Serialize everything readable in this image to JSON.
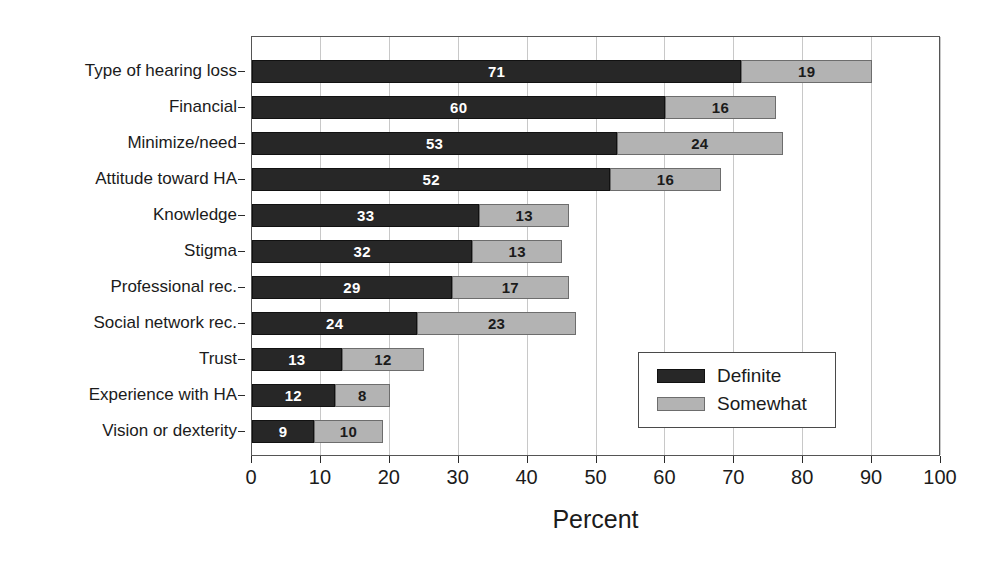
{
  "chart_data": {
    "type": "bar",
    "orientation": "horizontal",
    "stacked": true,
    "title": "",
    "xlabel": "Percent",
    "ylabel": "",
    "xlim": [
      0,
      100
    ],
    "xticks": [
      0,
      10,
      20,
      30,
      40,
      50,
      60,
      70,
      80,
      90,
      100
    ],
    "grid": true,
    "legend_position": "center-right",
    "categories": [
      "Type of hearing loss",
      "Financial",
      "Minimize/need",
      "Attitude toward HA",
      "Knowledge",
      "Stigma",
      "Professional rec.",
      "Social network rec.",
      "Trust",
      "Experience with HA",
      "Vision or dexterity"
    ],
    "series": [
      {
        "name": "Definite",
        "color": "#272727",
        "values": [
          71,
          60,
          53,
          52,
          33,
          32,
          29,
          24,
          13,
          12,
          9
        ]
      },
      {
        "name": "Somewhat",
        "color": "#b3b3b3",
        "values": [
          19,
          16,
          24,
          16,
          13,
          13,
          17,
          23,
          12,
          8,
          10
        ]
      }
    ]
  },
  "legend": {
    "entries": [
      {
        "label": "Definite",
        "swatch": "definite"
      },
      {
        "label": "Somewhat",
        "swatch": "somewhat"
      }
    ]
  }
}
